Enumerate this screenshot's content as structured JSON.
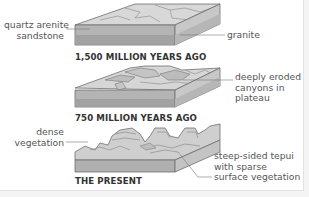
{
  "diagram": {
    "type": "geological formation stages",
    "stages": [
      {
        "caption": "1,500 MILLION YEARS AGO",
        "labels": {
          "left": "quartz arenite\nsandstone",
          "right": "granite"
        }
      },
      {
        "caption": "750 MILLION YEARS AGO",
        "labels": {
          "right": "deeply eroded\ncanyons in\nplateau"
        }
      },
      {
        "caption": "THE PRESENT",
        "labels": {
          "left": "dense\nvegetation",
          "right": "steep-sided tepui\nwith sparse\nsurface vegetation"
        }
      }
    ],
    "colors": {
      "top_surface": "#d6d6d6",
      "front_sandstone": "#b9b9b9",
      "front_granite": "#a4a4a4",
      "side_face": "#c6c6c6",
      "outline": "#6f6f6f",
      "leader_line": "#777777",
      "label_text": "#555555",
      "caption_text": "#333333"
    }
  }
}
